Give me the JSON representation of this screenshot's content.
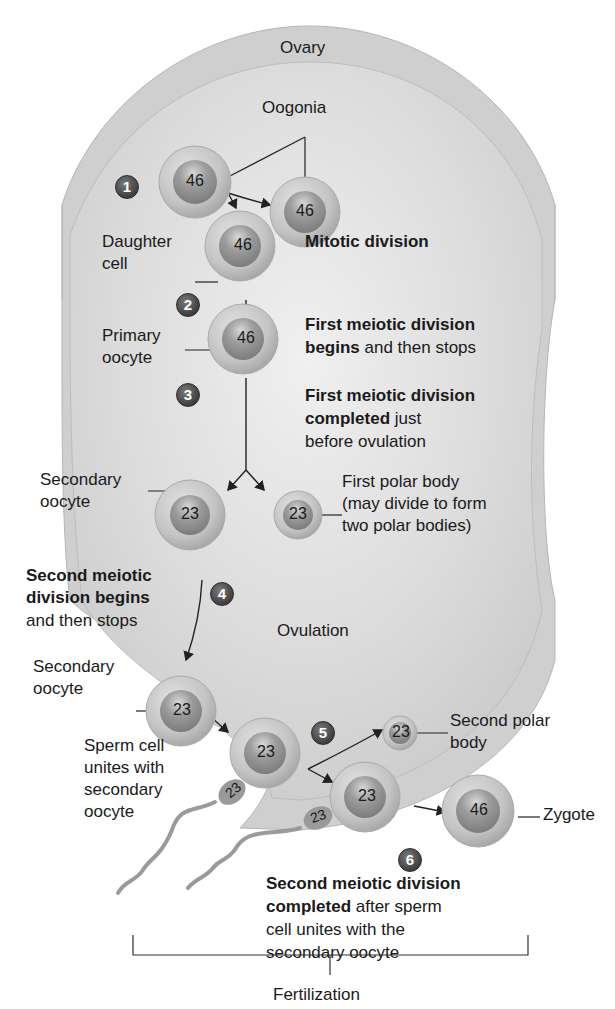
{
  "labels": {
    "ovary": "Ovary",
    "oogonia": "Oogonia",
    "daughter_cell_1": "Daughter",
    "daughter_cell_2": "cell",
    "primary_oocyte_1": "Primary",
    "primary_oocyte_2": "oocyte",
    "secondary_oocyte_a1": "Secondary",
    "secondary_oocyte_a2": "oocyte",
    "first_polar_body_1": "First polar body",
    "first_polar_body_2": "(may divide to form",
    "first_polar_body_3": "two polar bodies)",
    "ovulation": "Ovulation",
    "secondary_oocyte_b1": "Secondary",
    "secondary_oocyte_b2": "oocyte",
    "sperm_1": "Sperm cell",
    "sperm_2": "unites with",
    "sperm_3": "secondary",
    "sperm_4": "oocyte",
    "second_polar_body_1": "Second polar",
    "second_polar_body_2": "body",
    "zygote": "Zygote",
    "fertilization": "Fertilization"
  },
  "descriptions": {
    "mitotic": {
      "bold": "Mitotic division"
    },
    "first_begins": {
      "bold_1": "First meiotic division",
      "bold_2": "begins",
      "rest_2": " and then stops"
    },
    "first_completed": {
      "bold_1": "First meiotic division",
      "bold_2": "completed",
      "rest_2": " just",
      "line_3": "before ovulation"
    },
    "second_begins": {
      "bold_1": "Second meiotic",
      "bold_2": "division begins",
      "line_3": "and then stops"
    },
    "second_completed": {
      "bold_1": "Second meiotic division",
      "bold_2": "completed",
      "rest_2": " after sperm",
      "line_3": "cell unites with the",
      "line_4": "secondary oocyte"
    }
  },
  "steps": [
    "1",
    "2",
    "3",
    "4",
    "5",
    "6"
  ],
  "chromosome_counts": {
    "oogonium_1": "46",
    "oogonium_2": "46",
    "daughter_cell": "46",
    "primary_oocyte": "46",
    "secondary_oocyte_a": "23",
    "first_polar_body": "23",
    "secondary_oocyte_b": "23",
    "oocyte_with_sperm": "23",
    "second_polar_body": "23",
    "oocyte_completed": "23",
    "zygote": "46",
    "sperm_1": "23",
    "sperm_2": "23"
  },
  "colors": {
    "ovary_outer": "#c9c9c9",
    "ovary_inner": "#dedede",
    "cell_outer": "#bdbdbd",
    "cell_nucleus": "#8e8e8e",
    "step_badge": "#4a4a4a"
  }
}
